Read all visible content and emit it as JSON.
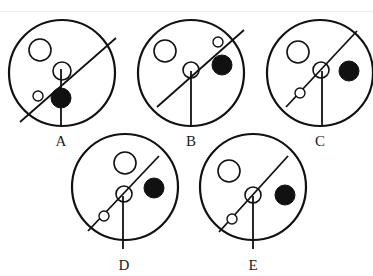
{
  "figure": {
    "stroke_color": "#111111",
    "fill_color": "#111111",
    "options": [
      {
        "label": "A",
        "cx": 62,
        "cy": 73,
        "r": 53,
        "diagonal": [
          [
            116,
            38
          ],
          [
            20,
            122
          ]
        ],
        "vertical": [
          [
            61,
            69
          ],
          [
            61,
            125
          ]
        ],
        "hollow_big": {
          "cx": 40,
          "cy": 50,
          "r": 11
        },
        "hollow_mid": {
          "cx": 62,
          "cy": 71,
          "r": 9
        },
        "hollow_small": {
          "cx": 38,
          "cy": 96,
          "r": 5
        },
        "filled": {
          "cx": 61,
          "cy": 98,
          "r": 10
        }
      },
      {
        "label": "B",
        "cx": 191,
        "cy": 73,
        "r": 53,
        "diagonal": [
          [
            244,
            30
          ],
          [
            157,
            107
          ]
        ],
        "vertical": [
          [
            191,
            71
          ],
          [
            191,
            125
          ]
        ],
        "hollow_big": {
          "cx": 165,
          "cy": 51,
          "r": 11
        },
        "hollow_mid": {
          "cx": 191,
          "cy": 70,
          "r": 8
        },
        "hollow_small": {
          "cx": 218,
          "cy": 42,
          "r": 5
        },
        "filled": {
          "cx": 222,
          "cy": 65,
          "r": 10
        }
      },
      {
        "label": "C",
        "cx": 320,
        "cy": 73,
        "r": 53,
        "diagonal": [
          [
            357,
            31
          ],
          [
            286,
            107
          ]
        ],
        "vertical": [
          [
            322,
            71
          ],
          [
            322,
            125
          ]
        ],
        "hollow_big": {
          "cx": 298,
          "cy": 52,
          "r": 11
        },
        "hollow_mid": {
          "cx": 321,
          "cy": 70,
          "r": 8
        },
        "hollow_small": {
          "cx": 300,
          "cy": 93,
          "r": 5
        },
        "filled": {
          "cx": 349,
          "cy": 71,
          "r": 10
        }
      },
      {
        "label": "D",
        "cx": 125,
        "cy": 187,
        "r": 53,
        "diagonal": [
          [
            159,
            156
          ],
          [
            88,
            231
          ]
        ],
        "vertical": [
          [
            123,
            196
          ],
          [
            123,
            249
          ]
        ],
        "hollow_big": {
          "cx": 125,
          "cy": 163,
          "r": 11
        },
        "hollow_mid": {
          "cx": 124,
          "cy": 194,
          "r": 8
        },
        "hollow_small": {
          "cx": 104,
          "cy": 216,
          "r": 5
        },
        "filled": {
          "cx": 154,
          "cy": 188,
          "r": 10
        }
      },
      {
        "label": "E",
        "cx": 253,
        "cy": 187,
        "r": 53,
        "diagonal": [
          [
            288,
            156
          ],
          [
            219,
            232
          ]
        ],
        "vertical": [
          [
            253,
            196
          ],
          [
            253,
            249
          ]
        ],
        "hollow_big": {
          "cx": 229,
          "cy": 171,
          "r": 11
        },
        "hollow_mid": {
          "cx": 253,
          "cy": 195,
          "r": 8
        },
        "hollow_small": {
          "cx": 232,
          "cy": 219,
          "r": 5
        },
        "filled": {
          "cx": 285,
          "cy": 195,
          "r": 10
        }
      }
    ]
  },
  "labels": {
    "a": "A",
    "b": "B",
    "c": "C",
    "d": "D",
    "e": "E"
  }
}
